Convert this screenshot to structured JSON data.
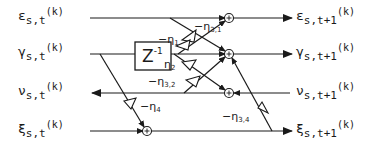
{
  "diagram": {
    "type": "signal-flow lattice stage",
    "inputs": [
      {
        "symbol": "ε",
        "sub": "s,t",
        "sup": "(k)"
      },
      {
        "symbol": "γ",
        "sub": "s,t",
        "sup": "(k)"
      },
      {
        "symbol": "ν",
        "sub": "s,t",
        "sup": "(k)"
      },
      {
        "symbol": "ξ",
        "sub": "s,t",
        "sup": "(k)"
      }
    ],
    "outputs": [
      {
        "symbol": "ε",
        "sub": "s,t+1",
        "sup": "(k)"
      },
      {
        "symbol": "γ",
        "sub": "s,t+1",
        "sup": "(k)"
      },
      {
        "symbol": "ν",
        "sub": "s,t+1",
        "sup": "(k)"
      },
      {
        "symbol": "ξ",
        "sub": "s,t+1",
        "sup": "(k)"
      }
    ],
    "delay_block": {
      "label": "Z",
      "exponent": "-1"
    },
    "gains": {
      "eta31": {
        "prefix": "−η",
        "sub": "3,1"
      },
      "eta1": {
        "prefix": "−η",
        "sub": "1"
      },
      "eta2": {
        "prefix": "η",
        "sub": "2"
      },
      "eta32": {
        "prefix": "−η",
        "sub": "3,2"
      },
      "eta4": {
        "prefix": "−η",
        "sub": "4"
      },
      "eta34": {
        "prefix": "−η",
        "sub": "3,4"
      }
    },
    "sum_symbol": "+"
  }
}
